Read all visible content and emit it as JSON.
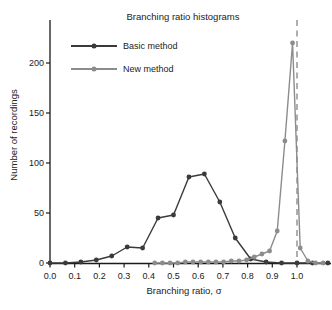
{
  "chart": {
    "title": "Branching ratio histograms",
    "ylabel": "Number of recordings",
    "xlabel": "Branching ratio, σ"
  },
  "legend": {
    "items": [
      {
        "label": "Basic method"
      },
      {
        "label": "New method"
      }
    ]
  },
  "colors": {
    "basic_method": "#3a3a3a",
    "new_method": "#8c8c8c",
    "reference_line": "#9c9c9c",
    "axis": "#1a1a1a",
    "background": "#ffffff"
  },
  "chart_data": {
    "type": "line",
    "title": "Branching ratio histograms",
    "xlabel": "Branching ratio, σ",
    "ylabel": "Number of recordings",
    "xlim": [
      0,
      1.13
    ],
    "ylim": [
      0,
      243
    ],
    "grid": false,
    "legend_position": "upper-left",
    "x_ticks": [
      0.0,
      0.1,
      0.2,
      0.3,
      0.4,
      0.5,
      0.6,
      0.7,
      0.8,
      0.9,
      1.0
    ],
    "x_tick_labels": [
      "0.0",
      "0.1",
      "0.2",
      "0.3",
      "0.4",
      "0.5",
      "0.6",
      "0.7",
      "0.8",
      "0.9",
      "1.0"
    ],
    "y_ticks": [
      0,
      50,
      100,
      150,
      200
    ],
    "y_tick_labels": [
      "0",
      "50",
      "100",
      "150",
      "200"
    ],
    "reference_line": {
      "x": 1.0,
      "style": "dashed",
      "color": "#9c9c9c"
    },
    "series": [
      {
        "name": "Basic method",
        "color": "#3a3a3a",
        "marker": "circle",
        "x": [
          0.0,
          0.0625,
          0.125,
          0.1875,
          0.25,
          0.3125,
          0.375,
          0.4375,
          0.5,
          0.5625,
          0.625,
          0.6875,
          0.75,
          0.8125,
          0.875,
          0.9375,
          1.0,
          1.0625,
          1.125
        ],
        "y": [
          0,
          0,
          1,
          3,
          7,
          16,
          15,
          45,
          48,
          86,
          89,
          61,
          25,
          4,
          1,
          0,
          0,
          0,
          0
        ]
      },
      {
        "name": "New method",
        "color": "#8c8c8c",
        "marker": "circle",
        "x": [
          0.424,
          0.455,
          0.486,
          0.517,
          0.548,
          0.579,
          0.61,
          0.641,
          0.672,
          0.703,
          0.734,
          0.765,
          0.796,
          0.827,
          0.858,
          0.889,
          0.92,
          0.951,
          0.982,
          1.013,
          1.044,
          1.075,
          1.106
        ],
        "y": [
          0,
          0,
          0,
          0,
          1,
          1,
          1,
          1,
          1,
          1,
          2,
          2,
          3,
          6,
          9,
          12,
          32,
          122,
          220,
          15,
          2,
          0,
          0
        ]
      }
    ]
  }
}
